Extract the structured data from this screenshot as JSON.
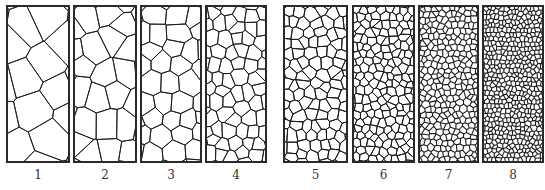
{
  "figure": {
    "panels": [
      {
        "label": "1",
        "x": 7,
        "y": 6,
        "w": 62,
        "h": 156,
        "cells": 9
      },
      {
        "label": "2",
        "x": 74,
        "y": 6,
        "w": 62,
        "h": 156,
        "cells": 16
      },
      {
        "label": "3",
        "x": 141,
        "y": 6,
        "w": 60,
        "h": 156,
        "cells": 30
      },
      {
        "label": "4",
        "x": 206,
        "y": 6,
        "w": 60,
        "h": 156,
        "cells": 60
      },
      {
        "label": "5",
        "x": 284,
        "y": 6,
        "w": 63,
        "h": 156,
        "cells": 95
      },
      {
        "label": "6",
        "x": 353,
        "y": 6,
        "w": 61,
        "h": 156,
        "cells": 170
      },
      {
        "label": "7",
        "x": 419,
        "y": 6,
        "w": 59,
        "h": 156,
        "cells": 290
      },
      {
        "label": "8",
        "x": 483,
        "y": 6,
        "w": 60,
        "h": 156,
        "cells": 480
      }
    ],
    "colors": {
      "border": "#2a2a2a",
      "grain_boundary": "#1a1a1a",
      "fill": "#ffffff",
      "label": "#333333"
    }
  }
}
